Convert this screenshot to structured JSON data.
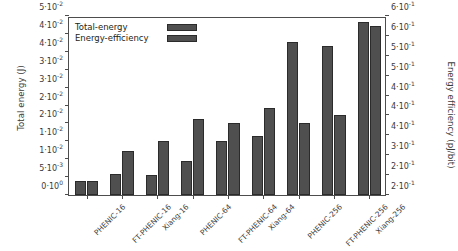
{
  "chart_data": {
    "type": "bar",
    "title": "",
    "xlabel": "",
    "ylabel": "Total energy (J)",
    "y2label": "Energy efficiency (pJ/bit)",
    "grid": false,
    "legend_position": "top-left",
    "categories": [
      "PHENIC-16",
      "FT-PHENIC-16",
      "Xiang-16",
      "PHENIC-64",
      "FT-PHENIC-64",
      "Xiang-64",
      "PHENIC-256",
      "FT-PHENIC-256",
      "Xiang-256"
    ],
    "ylim": [
      0,
      0.05
    ],
    "y2lim": [
      0.2,
      0.65
    ],
    "yticks": [
      0,
      0.005,
      0.01,
      0.015,
      0.02,
      0.025,
      0.03,
      0.035,
      0.04,
      0.045,
      0.05
    ],
    "yticklabels": [
      "0·10",
      "5·10",
      "1·10",
      "1·10",
      "2·10",
      "2·10",
      "3·10",
      "3·10",
      "4·10",
      "4·10",
      "5·10"
    ],
    "ytickexps": [
      "0",
      "-3",
      "-2",
      "-2",
      "-2",
      "-2",
      "-2",
      "-2",
      "-2",
      "-2",
      "-2"
    ],
    "y2ticks": [
      0.2,
      0.25,
      0.3,
      0.35,
      0.4,
      0.45,
      0.5,
      0.55,
      0.6,
      0.65
    ],
    "y2ticklabels": [
      "2·10",
      "2·10",
      "3·10",
      "4·10",
      "4·10",
      "4·10",
      "5·10",
      "5·10",
      "6·10",
      "6·10"
    ],
    "y2tickexps": [
      "-1",
      "-1",
      "-1",
      "-1",
      "-1",
      "-1",
      "-1",
      "-1",
      "-1",
      "-1"
    ],
    "series": [
      {
        "name": "Total-energy",
        "axis": "left",
        "color": "#4f4f4f",
        "values": [
          0.004,
          0.006,
          0.0056,
          0.0096,
          0.0151,
          0.0165,
          0.0427,
          0.0415,
          0.0482
        ]
      },
      {
        "name": "Energy-efficiency",
        "axis": "right",
        "color": "#4f4f4f",
        "values": [
          0.235,
          0.31,
          0.335,
          0.39,
          0.38,
          0.42,
          0.38,
          0.4,
          0.625
        ]
      }
    ]
  },
  "legend": {
    "items": [
      {
        "label": "Total-energy"
      },
      {
        "label": "Energy-efficiency"
      }
    ]
  },
  "colors": {
    "bar": "#4f4f4f",
    "bar_edge": "#2b2b2b",
    "axis": "#4d4d4d",
    "text": "#3a3a3a",
    "background": "#ffffff"
  }
}
